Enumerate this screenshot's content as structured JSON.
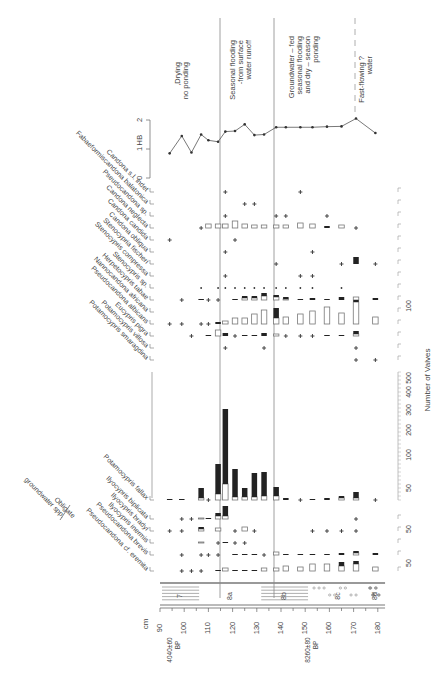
{
  "chart_data": {
    "type": "table",
    "orientation": "rotated 90deg (depth runs left-to-right along bottom)",
    "depth_axis": {
      "label": "cm",
      "ticks": [
        90,
        100,
        110,
        120,
        130,
        140,
        150,
        160,
        170,
        180
      ],
      "range": [
        90,
        183
      ]
    },
    "radiocarbon_dates": [
      {
        "label": "4040±60 BP",
        "depth": 98
      },
      {
        "label": "8260±80 BP",
        "depth": 155
      }
    ],
    "lithology_units": [
      {
        "label": "7",
        "from": 90,
        "to": 107,
        "pattern": "lines"
      },
      {
        "label": "8a",
        "from": 107,
        "to": 131,
        "pattern": "blank"
      },
      {
        "label": "8b",
        "from": 131,
        "to": 152,
        "pattern": "lines"
      },
      {
        "label": "8c",
        "from": 152,
        "to": 175,
        "pattern": "gravel"
      },
      {
        "label": "8d",
        "from": 175,
        "to": 183,
        "pattern": "gravel-dense"
      },
      {
        "label": "8e",
        "from": 174,
        "to": 177,
        "pattern": "gravel-dense"
      }
    ],
    "zones": [
      {
        "label": "Drying,\nno ponding",
        "from": 90,
        "to": 112
      },
      {
        "label": "Seasonal flooding\nfrom surface-\nwater runoff",
        "from": 112,
        "to": 139
      },
      {
        "label": "Groundwater – fed\nseasonal flooding\nand dry – season\nponding",
        "from": 139,
        "to": 171
      },
      {
        "label": "? Fast-flowing\nwater",
        "from": 171,
        "to": 183
      }
    ],
    "hb_axis": {
      "label": "HB",
      "ticks": [
        0,
        1,
        2
      ]
    },
    "sample_depths": [
      94,
      99,
      103,
      107,
      110,
      114,
      117,
      121,
      125,
      129,
      133,
      138,
      142,
      148,
      153,
      159,
      165,
      171,
      179
    ],
    "hb_values": [
      0.85,
      1.45,
      0.88,
      1.5,
      1.3,
      1.25,
      1.6,
      1.62,
      1.85,
      1.48,
      1.5,
      1.75,
      1.75,
      1.75,
      1.75,
      1.77,
      1.78,
      2.05,
      1.55
    ],
    "valve_axis": {
      "label": "Number of Valves",
      "scale_ticks": [
        50,
        100,
        200,
        300,
        400,
        500
      ],
      "row_scale_ticks": [
        50,
        100
      ]
    },
    "species_groups": [
      {
        "label": "Obligate groundwater spp.",
        "species": [
          "Pseudocandona cf. eremita",
          "Pseudocandona brevis",
          "Ilyocypris inermis",
          "Ilyocypris bradyi"
        ]
      }
    ],
    "species": [
      "Candona s.l. indet",
      "Fabaeformiscandona balatonica",
      "Pseudocandona sp.",
      "Candona neglecta",
      "Candona candida",
      "Candona obliqua",
      "Stenocypria fischeri",
      "Stenocypris compressa",
      "Stenocypris sp.",
      "Herpetocypris tabae",
      "Nannocandona africana",
      "Pseudocandona albicans",
      "Eucypris pigra",
      "Potamocypris villosa",
      "Potamocypris smaragdina",
      "Potamocypris fallax",
      "Ilyocypris biplicata",
      "Ilyocypris bradyi",
      "Ilyocypris inermis",
      "Pseudocandona brevis",
      "Pseudocandona cf. eremita"
    ],
    "legend": {
      "open_box": "valves",
      "filled_box": "juveniles/carapaces",
      "plus": "present (<1 valve-scale)"
    }
  },
  "labels": {
    "depth_unit": "cm",
    "hb": "HB",
    "valves_axis": "Number of Valves",
    "obligate": "Obligate",
    "groundwater_spp": "groundwater spp.",
    "date1": "4040±60",
    "date1_bp": "BP",
    "date2": "8260±80",
    "date2_bp": "BP"
  }
}
